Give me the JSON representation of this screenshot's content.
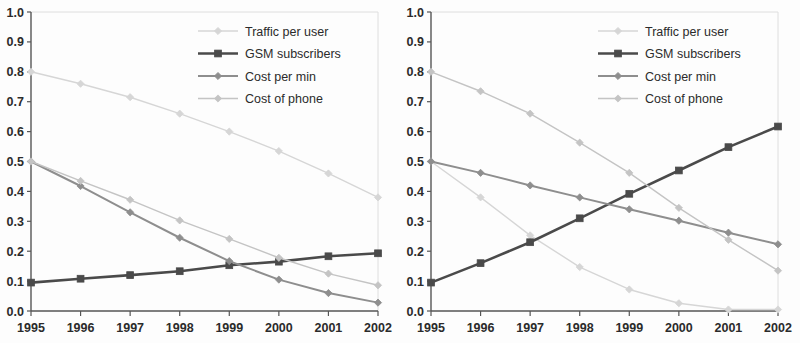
{
  "figure": {
    "panel_count": 2,
    "background": "#fdfdfd"
  },
  "series_styles": {
    "traffic_per_user": {
      "color": "#d6d6d6",
      "marker": "diamond",
      "width": 1.4
    },
    "gsm_subscribers": {
      "color": "#4a4a4a",
      "marker": "square",
      "width": 2.6
    },
    "cost_per_min": {
      "color": "#8e8e8e",
      "marker": "diamond",
      "width": 2.0
    },
    "cost_of_phone": {
      "color": "#c4c4c4",
      "marker": "diamond",
      "width": 1.4
    }
  },
  "chart_data": [
    {
      "type": "line",
      "panel": "left",
      "title": "",
      "subtitle": "",
      "xlabel": "",
      "ylabel": "",
      "x": [
        "1995",
        "1996",
        "1997",
        "1998",
        "1999",
        "2000",
        "2001",
        "2002"
      ],
      "categories": [
        "1995",
        "1996",
        "1997",
        "1998",
        "1999",
        "2000",
        "2001",
        "2002"
      ],
      "xlim": [
        1995,
        2002
      ],
      "ylim": [
        0.0,
        1.0
      ],
      "yticks": [
        "0.0",
        "0.1",
        "0.2",
        "0.3",
        "0.4",
        "0.5",
        "0.6",
        "0.7",
        "0.8",
        "0.9",
        "1.0"
      ],
      "xticks": [
        "1995",
        "1996",
        "1997",
        "1998",
        "1999",
        "2000",
        "2001",
        "2002"
      ],
      "grid": false,
      "legend_position": "top-right",
      "series": [
        {
          "name": "Traffic per user",
          "key": "traffic_per_user",
          "values": [
            0.8,
            0.76,
            0.715,
            0.66,
            0.6,
            0.535,
            0.46,
            0.38
          ]
        },
        {
          "name": "GSM subscribers",
          "key": "gsm_subscribers",
          "values": [
            0.095,
            0.108,
            0.12,
            0.133,
            0.153,
            0.165,
            0.183,
            0.193
          ]
        },
        {
          "name": "Cost per min",
          "key": "cost_per_min",
          "values": [
            0.5,
            0.418,
            0.33,
            0.245,
            0.167,
            0.105,
            0.06,
            0.028
          ]
        },
        {
          "name": "Cost of phone",
          "key": "cost_of_phone",
          "values": [
            0.5,
            0.435,
            0.372,
            0.303,
            0.241,
            0.178,
            0.125,
            0.086
          ]
        }
      ]
    },
    {
      "type": "line",
      "panel": "right",
      "title": "",
      "subtitle": "",
      "xlabel": "",
      "ylabel": "",
      "x": [
        "1995",
        "1996",
        "1997",
        "1998",
        "1999",
        "2000",
        "2001",
        "2002"
      ],
      "categories": [
        "1995",
        "1996",
        "1997",
        "1998",
        "1999",
        "2000",
        "2001",
        "2002"
      ],
      "xlim": [
        1995,
        2002
      ],
      "ylim": [
        0.0,
        1.0
      ],
      "yticks": [
        "0.0",
        "0.1",
        "0.2",
        "0.3",
        "0.4",
        "0.5",
        "0.6",
        "0.7",
        "0.8",
        "0.9",
        "1.0"
      ],
      "xticks": [
        "1995",
        "1996",
        "1997",
        "1998",
        "1999",
        "2000",
        "2001",
        "2002"
      ],
      "grid": false,
      "legend_position": "top-right",
      "series": [
        {
          "name": "Traffic per user",
          "key": "traffic_per_user",
          "values": [
            0.5,
            0.38,
            0.253,
            0.147,
            0.072,
            0.026,
            0.005,
            0.005
          ]
        },
        {
          "name": "GSM subscribers",
          "key": "gsm_subscribers",
          "values": [
            0.095,
            0.16,
            0.23,
            0.31,
            0.392,
            0.47,
            0.548,
            0.617
          ]
        },
        {
          "name": "Cost per min",
          "key": "cost_per_min",
          "values": [
            0.5,
            0.462,
            0.42,
            0.38,
            0.34,
            0.302,
            0.262,
            0.223
          ]
        },
        {
          "name": "Cost of phone",
          "key": "cost_of_phone",
          "values": [
            0.8,
            0.735,
            0.66,
            0.563,
            0.462,
            0.345,
            0.238,
            0.135
          ]
        }
      ]
    }
  ],
  "legend": {
    "items": [
      {
        "label": "Traffic per user",
        "key": "traffic_per_user"
      },
      {
        "label": "GSM subscribers",
        "key": "gsm_subscribers"
      },
      {
        "label": "Cost per min",
        "key": "cost_per_min"
      },
      {
        "label": "Cost of phone",
        "key": "cost_of_phone"
      }
    ]
  }
}
